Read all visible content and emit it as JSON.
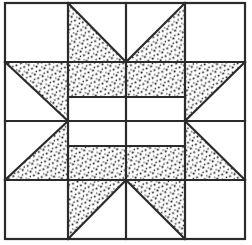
{
  "figure": {
    "name": "quilt-block-diagram",
    "kind": "line-drawing",
    "title": "",
    "caption": "",
    "width": 252,
    "height": 245,
    "background_color": "#ffffff",
    "line_color": "#2b2b2b",
    "fill_pattern_color": "#1a1a1a",
    "fill_background_color": "#ffffff",
    "stroke_width": 2.2,
    "outer_border": {
      "left": 5,
      "top": 3,
      "right": 245,
      "bottom": 239
    },
    "grid": {
      "columns": 4,
      "rows": 4,
      "x_lines": [
        5,
        68,
        126,
        185,
        245
      ],
      "y_lines": [
        3,
        62,
        121,
        180,
        239
      ]
    },
    "inner_band_offsets": {
      "top_band_y": 97,
      "mid_band_y": 121,
      "bottom_band_y": 146,
      "band_left_x": 68,
      "band_right_x": 185
    },
    "patches": [
      {
        "id": "r1c1",
        "row": 1,
        "col": 1,
        "shape": "square",
        "fill": "plain"
      },
      {
        "id": "r1c2",
        "row": 1,
        "col": 2,
        "shape": "triangle",
        "fill": "dotted",
        "corner": "top-left"
      },
      {
        "id": "r1c3",
        "row": 1,
        "col": 3,
        "shape": "triangle",
        "fill": "dotted",
        "corner": "top-right"
      },
      {
        "id": "r1c4",
        "row": 1,
        "col": 4,
        "shape": "square",
        "fill": "plain"
      },
      {
        "id": "r2c1",
        "row": 2,
        "col": 1,
        "shape": "triangle",
        "fill": "dotted",
        "corner": "top-right"
      },
      {
        "id": "r2c2",
        "row": 2,
        "col": 2,
        "shape": "band",
        "fill": "dotted",
        "corner": "center"
      },
      {
        "id": "r2c3",
        "row": 2,
        "col": 3,
        "shape": "band",
        "fill": "dotted",
        "corner": "center"
      },
      {
        "id": "r2c4",
        "row": 2,
        "col": 4,
        "shape": "triangle",
        "fill": "dotted",
        "corner": "top-left"
      },
      {
        "id": "r3c1",
        "row": 3,
        "col": 1,
        "shape": "triangle",
        "fill": "dotted",
        "corner": "bottom-right"
      },
      {
        "id": "r3c2",
        "row": 3,
        "col": 2,
        "shape": "band",
        "fill": "dotted",
        "corner": "center"
      },
      {
        "id": "r3c3",
        "row": 3,
        "col": 3,
        "shape": "band",
        "fill": "dotted",
        "corner": "center"
      },
      {
        "id": "r3c4",
        "row": 3,
        "col": 4,
        "shape": "triangle",
        "fill": "dotted",
        "corner": "bottom-left"
      },
      {
        "id": "r4c1",
        "row": 4,
        "col": 1,
        "shape": "square",
        "fill": "plain"
      },
      {
        "id": "r4c2",
        "row": 4,
        "col": 2,
        "shape": "triangle",
        "fill": "dotted",
        "corner": "bottom-left"
      },
      {
        "id": "r4c3",
        "row": 4,
        "col": 3,
        "shape": "triangle",
        "fill": "dotted",
        "corner": "bottom-right"
      },
      {
        "id": "r4c4",
        "row": 4,
        "col": 4,
        "shape": "square",
        "fill": "plain"
      }
    ]
  }
}
